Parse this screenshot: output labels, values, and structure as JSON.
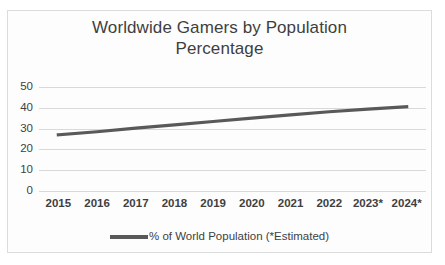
{
  "chart_data": {
    "type": "line",
    "title": "Worldwide Gamers by Population Percentage",
    "title_lines": [
      "Worldwide Gamers by Population",
      "Percentage"
    ],
    "xlabel": "",
    "ylabel": "",
    "categories": [
      "2015",
      "2016",
      "2017",
      "2018",
      "2019",
      "2020",
      "2021",
      "2022",
      "2023*",
      "2024*"
    ],
    "series": [
      {
        "name": "% of World Population (*Estimated)",
        "values": [
          27.0,
          28.5,
          30.2,
          31.8,
          33.4,
          35.0,
          36.6,
          38.1,
          39.4,
          40.5
        ],
        "color": "#595959"
      }
    ],
    "ylim": [
      0,
      50
    ],
    "yticks": [
      "0",
      "10",
      "20",
      "30",
      "40",
      "50"
    ],
    "ytick_values": [
      0,
      10,
      20,
      30,
      40,
      50
    ],
    "grid": "horizontal",
    "legend_position": "bottom",
    "legend_entries": [
      "% of World Population (*Estimated)"
    ],
    "colors": {
      "line": "#595959",
      "gridline": "#d9d9d9",
      "text": "#3f3f3f",
      "background": "#fdfdfd",
      "border": "#dcdcdc"
    }
  }
}
